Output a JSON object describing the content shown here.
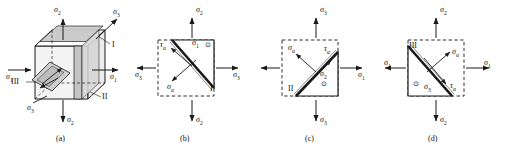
{
  "figure": {
    "type": "mechanics-stress-element-diagram",
    "caption_prefix": "",
    "panels": [
      {
        "id": "a",
        "caption": "(a)",
        "kind": "3d-cube-stress-element",
        "labels": [
          {
            "name": "sigma-2-top",
            "base": "σ",
            "sub": "2"
          },
          {
            "name": "sigma-3-top-right",
            "base": "σ",
            "sub": "3"
          },
          {
            "name": "plane-I",
            "base": "I",
            "sub": ""
          },
          {
            "name": "sigma-1-left",
            "base": "σ",
            "sub": "1"
          },
          {
            "name": "sigma-1-right",
            "base": "σ",
            "sub": "1"
          },
          {
            "name": "plane-III",
            "base": "III",
            "sub": ""
          },
          {
            "name": "plane-II",
            "base": "II",
            "sub": ""
          },
          {
            "name": "sigma-3-bottom-left",
            "base": "σ",
            "sub": "3"
          },
          {
            "name": "sigma-2-bottom",
            "base": "σ",
            "sub": "2"
          }
        ]
      },
      {
        "id": "b",
        "caption": "(b)",
        "kind": "2d-wedge-free-body",
        "labels": [
          {
            "name": "sigma-2-top",
            "base": "σ",
            "sub": "2"
          },
          {
            "name": "tau-alpha",
            "base": "τ",
            "sub": "α"
          },
          {
            "name": "sigma-1-inside",
            "base": "σ",
            "sub": "1"
          },
          {
            "name": "sigma-3-left",
            "base": "σ",
            "sub": "3"
          },
          {
            "name": "sigma-3-right",
            "base": "σ",
            "sub": "3"
          },
          {
            "name": "sigma-alpha",
            "base": "σ",
            "sub": "α"
          },
          {
            "name": "plane-I",
            "base": "I",
            "sub": ""
          },
          {
            "name": "sigma-2-bottom",
            "base": "σ",
            "sub": "2"
          }
        ]
      },
      {
        "id": "c",
        "caption": "(c)",
        "kind": "2d-wedge-free-body",
        "labels": [
          {
            "name": "sigma-3-top",
            "base": "σ",
            "sub": "3"
          },
          {
            "name": "sigma-alpha",
            "base": "σ",
            "sub": "α"
          },
          {
            "name": "tau-alpha",
            "base": "τ",
            "sub": "α"
          },
          {
            "name": "sigma-2-inside",
            "base": "σ",
            "sub": "2"
          },
          {
            "name": "plane-II",
            "base": "II",
            "sub": ""
          },
          {
            "name": "sigma-1-right",
            "base": "σ",
            "sub": "1"
          },
          {
            "name": "sigma-3-bottom",
            "base": "σ",
            "sub": "3"
          }
        ]
      },
      {
        "id": "d",
        "caption": "(d)",
        "kind": "2d-wedge-free-body",
        "labels": [
          {
            "name": "sigma-2-top",
            "base": "σ",
            "sub": "2"
          },
          {
            "name": "plane-III",
            "base": "III",
            "sub": ""
          },
          {
            "name": "sigma-alpha",
            "base": "σ",
            "sub": "α"
          },
          {
            "name": "sigma-1-left",
            "base": "σ",
            "sub": "1"
          },
          {
            "name": "sigma-1-right",
            "base": "σ",
            "sub": "1"
          },
          {
            "name": "tau-alpha",
            "base": "τ",
            "sub": "α"
          },
          {
            "name": "sigma-3-inside",
            "base": "σ",
            "sub": "3"
          },
          {
            "name": "sigma-2-bottom",
            "base": "σ",
            "sub": "2"
          }
        ]
      }
    ],
    "symbols": {
      "sigma": "σ",
      "tau": "τ",
      "alpha": "α",
      "out-of-plane-dot": "⊙"
    },
    "colors": {
      "line": "#1a1a1a",
      "shaded_plane": "#c8c8c8",
      "light_face": "#e3e3e3",
      "background": "#ffffff"
    }
  },
  "text": {
    "a": {
      "cap": "(a)",
      "s2t": "σ",
      "s2t_sub": "2",
      "s3tr": "σ",
      "s3tr_sub": "3",
      "I": "I",
      "s1l": "σ",
      "s1l_sub": "1",
      "s1r": "σ",
      "s1r_sub": "1",
      "III": "III",
      "II": "II",
      "s3bl": "σ",
      "s3bl_sub": "3",
      "s2b": "σ",
      "s2b_sub": "2"
    },
    "b": {
      "cap": "(b)",
      "s2t": "σ",
      "s2t_sub": "2",
      "ta": "τ",
      "ta_sub": "α",
      "s1i": "σ",
      "s1i_sub": "1",
      "s3l": "σ",
      "s3l_sub": "3",
      "s3r": "σ",
      "s3r_sub": "3",
      "sa": "σ",
      "sa_sub": "α",
      "I": "I",
      "s2b": "σ",
      "s2b_sub": "2",
      "dot": "⊙"
    },
    "c": {
      "cap": "(c)",
      "s3t": "σ",
      "s3t_sub": "3",
      "sa": "σ",
      "sa_sub": "α",
      "ta": "τ",
      "ta_sub": "α",
      "s2i": "σ",
      "s2i_sub": "2",
      "II": "II",
      "s1r": "σ",
      "s1r_sub": "1",
      "s3b": "σ",
      "s3b_sub": "3",
      "dot": "⊙"
    },
    "d": {
      "cap": "(d)",
      "s2t": "σ",
      "s2t_sub": "2",
      "III": "III",
      "sa": "σ",
      "sa_sub": "α",
      "s1l": "σ",
      "s1l_sub": "1",
      "s1r": "σ",
      "s1r_sub": "1",
      "ta": "τ",
      "ta_sub": "α",
      "s3i": "σ",
      "s3i_sub": "3",
      "s2b": "σ",
      "s2b_sub": "2",
      "dot": "⊙"
    }
  }
}
